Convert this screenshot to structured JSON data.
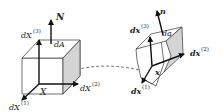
{
  "diagram": {
    "reference": {
      "normal_label": "N",
      "area_label": "dA",
      "position_label": "X",
      "edges": [
        {
          "base": "dX",
          "sup": "(1)"
        },
        {
          "base": "dX",
          "sup": "(2)"
        },
        {
          "base": "dX",
          "sup": "(3)"
        }
      ]
    },
    "deformed": {
      "normal_label": "n",
      "area_label": "da",
      "position_label": "x",
      "edges": [
        {
          "base": "dx",
          "sup": "(1)"
        },
        {
          "base": "dx",
          "sup": "(2)"
        },
        {
          "base": "dx",
          "sup": "(3)"
        }
      ]
    },
    "colors": {
      "line": "#333333",
      "arrow": "#111111",
      "shaded_face": "#d4d4d4",
      "dashed_path": "#555555"
    }
  }
}
